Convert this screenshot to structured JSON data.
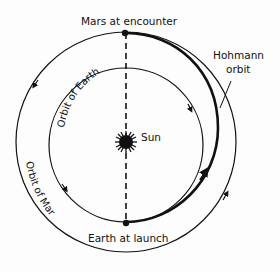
{
  "diagram": {
    "labels": {
      "mars_at_encounter": "Mars at encounter",
      "hohmann_orbit_line1": "Hohmann",
      "hohmann_orbit_line2": "orbit",
      "sun": "Sun",
      "orbit_of_earth": "Orbit of Earth",
      "orbit_of_mars": "Orbit of Mars",
      "earth_at_launch": "Earth at launch"
    },
    "colors": {
      "ink": "#111111",
      "background": "#fdfdfd"
    }
  }
}
